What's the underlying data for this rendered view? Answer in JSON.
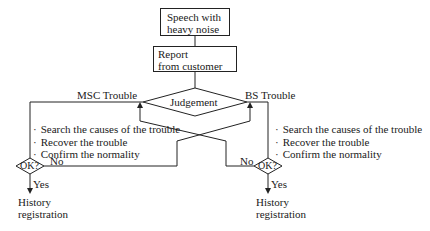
{
  "nodes": {
    "start": {
      "line1": "Speech with",
      "line2": "heavy noise"
    },
    "report": {
      "line1": "Report",
      "line2": "from customer"
    },
    "judgement": "Judgement",
    "ok_left": "OK?",
    "ok_right": "OK?"
  },
  "branches": {
    "msc": "MSC Trouble",
    "bs": "BS Trouble"
  },
  "left_steps": [
    "Search the causes of the trouble",
    "Recover the trouble",
    "Confirm the normality"
  ],
  "right_steps": [
    "Search the causes of the trouble",
    "Recover the trouble",
    "Confirm the normality"
  ],
  "labels": {
    "no_left": "No",
    "yes_left": "Yes",
    "no_right": "No",
    "yes_right": "Yes",
    "history_left": {
      "line1": "History",
      "line2": "registration"
    },
    "history_right": {
      "line1": "History",
      "line2": "registration"
    }
  }
}
